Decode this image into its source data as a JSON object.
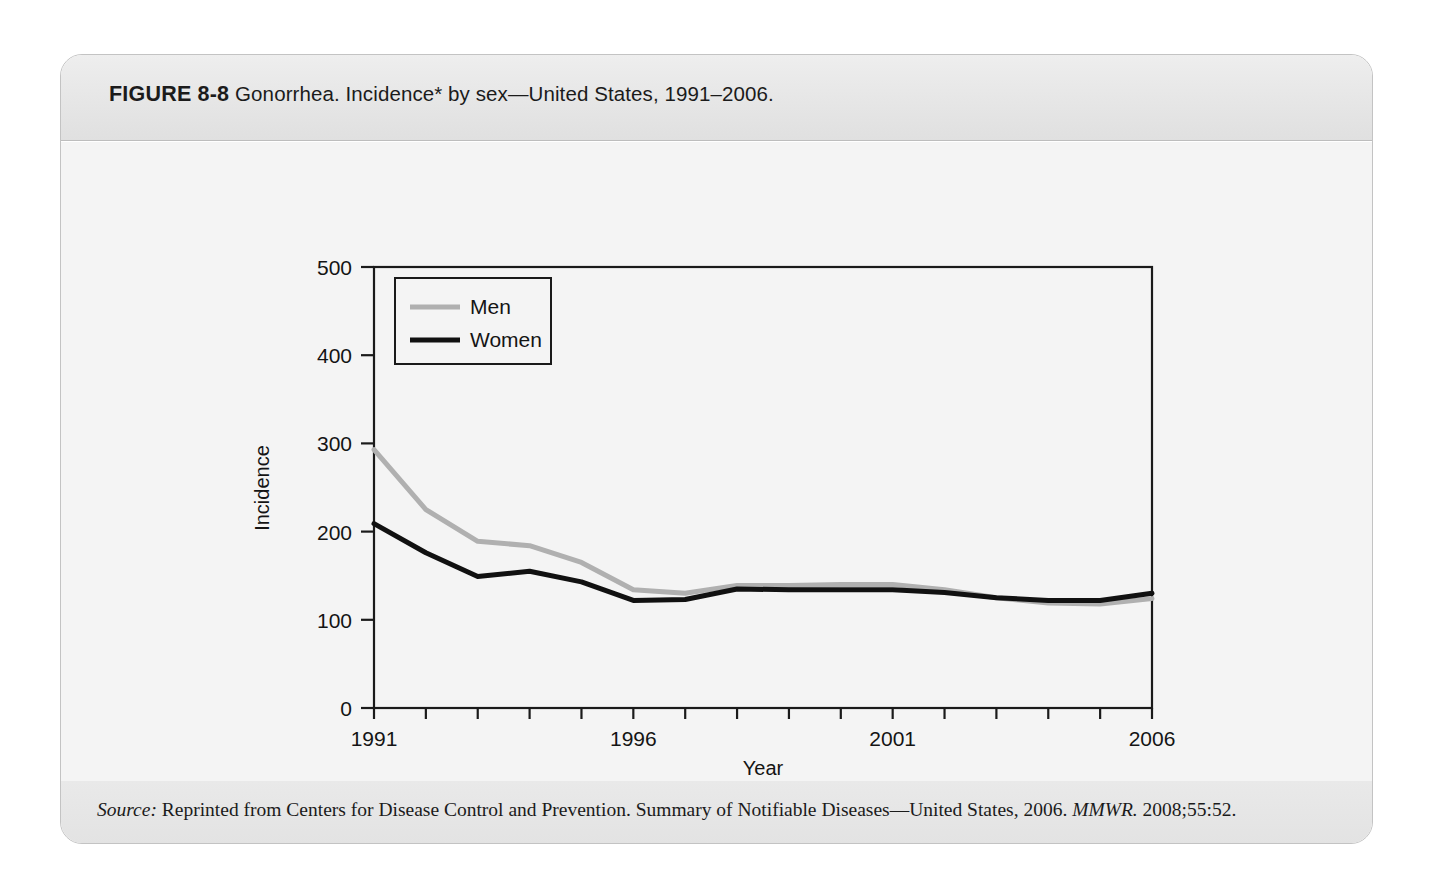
{
  "figure": {
    "number": "FIGURE 8-8",
    "caption": "Gonorrhea. Incidence* by sex—United States, 1991–2006.",
    "footnote": "*Per 100,000 population.",
    "source_prefix": "Source:",
    "source_text": " Reprinted from Centers for Disease Control and Prevention. Summary of Notifiable Diseases—United States, 2006. ",
    "source_italic_journal": "MMWR.",
    "source_suffix": " 2008;55:52."
  },
  "chart_data": {
    "type": "line",
    "title": "Gonorrhea. Incidence* by sex—United States, 1991–2006.",
    "xlabel": "Year",
    "ylabel": "Incidence",
    "x": [
      1991,
      1992,
      1993,
      1994,
      1995,
      1996,
      1997,
      1998,
      1999,
      2000,
      2001,
      2002,
      2003,
      2004,
      2005,
      2006
    ],
    "xlim": [
      1991,
      2006
    ],
    "ylim": [
      0,
      500
    ],
    "xticks": [
      1991,
      1992,
      1993,
      1994,
      1995,
      1996,
      1997,
      1998,
      1999,
      2000,
      2001,
      2002,
      2003,
      2004,
      2005,
      2006
    ],
    "xtick_labels": [
      "1991",
      "",
      "",
      "",
      "",
      "1996",
      "",
      "",
      "",
      "",
      "2001",
      "",
      "",
      "",
      "",
      "2006"
    ],
    "yticks": [
      0,
      100,
      200,
      300,
      400,
      500
    ],
    "ytick_labels": [
      "0",
      "100",
      "200",
      "300",
      "400",
      "500"
    ],
    "grid": false,
    "legend_position": "upper left",
    "series": [
      {
        "name": "Men",
        "color": "#b0b0b0",
        "values": [
          293,
          225,
          189,
          184,
          165,
          134,
          130,
          139,
          139,
          140,
          140,
          134,
          125,
          119,
          118,
          124
        ]
      },
      {
        "name": "Women",
        "color": "#111111",
        "values": [
          209,
          176,
          149,
          155,
          143,
          122,
          123,
          135,
          134,
          134,
          134,
          131,
          125,
          122,
          122,
          130
        ]
      }
    ]
  }
}
